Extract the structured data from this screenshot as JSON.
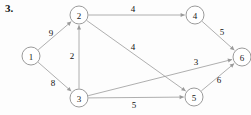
{
  "figure": {
    "problem_number": "3.",
    "caption": "",
    "background_color": "#fdfdfd",
    "node_stroke_color": "#8e8e8e",
    "edge_color": "#9a9a9a",
    "text_color": "#121212"
  },
  "chart_data": {
    "type": "diagram",
    "title": "3.",
    "graph_type": "directed weighted graph",
    "nodes": [
      {
        "id": "1",
        "label": "1",
        "x": 31,
        "y": 56,
        "r": 9
      },
      {
        "id": "2",
        "label": "2",
        "x": 79,
        "y": 15,
        "r": 9
      },
      {
        "id": "3",
        "label": "3",
        "x": 79,
        "y": 98,
        "r": 9
      },
      {
        "id": "4",
        "label": "4",
        "x": 195,
        "y": 15,
        "r": 9
      },
      {
        "id": "5",
        "label": "5",
        "x": 194,
        "y": 97,
        "r": 9
      },
      {
        "id": "6",
        "label": "6",
        "x": 242,
        "y": 57,
        "r": 9
      }
    ],
    "edges": [
      {
        "id": "e1-2",
        "from": "1",
        "to": "2",
        "weight": "9",
        "label_x": 51,
        "label_y": 33,
        "directed": true
      },
      {
        "id": "e1-3",
        "from": "1",
        "to": "3",
        "weight": "8",
        "label_x": 53,
        "label_y": 83,
        "directed": true
      },
      {
        "id": "e3-2",
        "from": "3",
        "to": "2",
        "weight": "2",
        "label_x": 72,
        "label_y": 56,
        "directed": true
      },
      {
        "id": "e2-4",
        "from": "2",
        "to": "4",
        "weight": "4",
        "label_x": 133,
        "label_y": 9,
        "directed": true
      },
      {
        "id": "e2-5",
        "from": "2",
        "to": "5",
        "weight": "4",
        "label_x": 133,
        "label_y": 47,
        "directed": true
      },
      {
        "id": "e3-6",
        "from": "3",
        "to": "6",
        "weight": "3",
        "label_x": 196,
        "label_y": 62,
        "directed": true
      },
      {
        "id": "e3-5",
        "from": "3",
        "to": "5",
        "weight": "5",
        "label_x": 134,
        "label_y": 105,
        "directed": true
      },
      {
        "id": "e4-6",
        "from": "4",
        "to": "6",
        "weight": "5",
        "label_x": 222,
        "label_y": 32,
        "directed": true
      },
      {
        "id": "e5-6",
        "from": "5",
        "to": "6",
        "weight": "6",
        "label_x": 219,
        "label_y": 80,
        "directed": true
      }
    ]
  }
}
